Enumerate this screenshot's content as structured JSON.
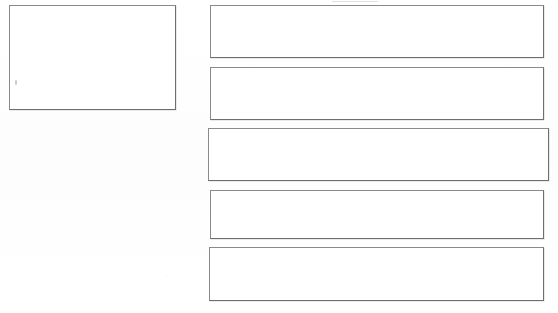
{
  "page": {
    "width": 558,
    "height": 313,
    "background_color": "#ffffff",
    "border_color": "#7a7a7a",
    "content_text": "",
    "visible_text": "none"
  },
  "left_panel": {
    "name": "large-empty-box",
    "label": "",
    "value": "",
    "x": 9,
    "y": 5,
    "width": 167,
    "height": 105,
    "filled": false,
    "mark": {
      "name": "pencil-speck",
      "x": 14,
      "y": 79
    }
  },
  "right_panel": {
    "name": "stacked-empty-boxes",
    "count": 5,
    "boxes": [
      {
        "index": 1,
        "label": "",
        "value": "",
        "x": 210,
        "y": 5,
        "width": 334,
        "height": 53,
        "filled": false
      },
      {
        "index": 2,
        "label": "",
        "value": "",
        "x": 210,
        "y": 67,
        "width": 334,
        "height": 53,
        "filled": false
      },
      {
        "index": 3,
        "label": "",
        "value": "",
        "x": 208,
        "y": 128,
        "width": 341,
        "height": 53,
        "filled": false
      },
      {
        "index": 4,
        "label": "",
        "value": "",
        "x": 210,
        "y": 190,
        "width": 334,
        "height": 49,
        "filled": false
      },
      {
        "index": 5,
        "label": "",
        "value": "",
        "x": 209,
        "y": 247,
        "width": 335,
        "height": 54,
        "filled": false
      }
    ]
  },
  "artifacts": {
    "top_mark": {
      "name": "scan-edge-artifact",
      "x": 332,
      "y": 1,
      "width": 46
    }
  }
}
